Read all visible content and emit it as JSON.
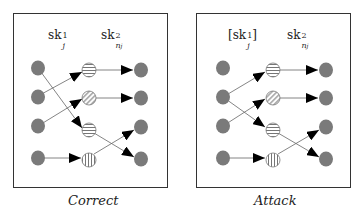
{
  "panels": [
    {
      "id": "correct",
      "caption": "Correct",
      "label_left": "sk",
      "label_left_sup": "1",
      "label_left_sub": "j",
      "label_left_bracketed": false,
      "label_right": "sk",
      "label_right_sup": "2",
      "label_right_sub": "n",
      "label_right_subsub": "j"
    },
    {
      "id": "attack",
      "caption": "Attack",
      "label_left": "sk",
      "label_left_sup": "1",
      "label_left_sub": "j",
      "label_left_bracketed": true,
      "label_right": "sk",
      "label_right_sup": "2",
      "label_right_sub": "n",
      "label_right_subsub": "j"
    }
  ],
  "colors": {
    "node_fill": "#7a7a7a",
    "edge": "#555555",
    "arrow": "#000000",
    "box": "#333333"
  },
  "nodes": {
    "left": [
      "solid",
      "solid",
      "solid",
      "solid"
    ],
    "middle": [
      "horizontal-stripes",
      "diagonal-stripes",
      "horizontal-stripes",
      "vertical-stripes"
    ],
    "right": [
      "solid",
      "solid",
      "solid",
      "solid"
    ]
  },
  "edges": {
    "correct": [
      [
        0,
        2
      ],
      [
        1,
        0
      ],
      [
        2,
        1
      ],
      [
        3,
        3
      ]
    ],
    "attack": [
      [
        1,
        2
      ],
      [
        1,
        0
      ],
      [
        2,
        1
      ],
      [
        3,
        3
      ]
    ],
    "middle_to_right": [
      [
        0,
        0
      ],
      [
        1,
        1
      ],
      [
        2,
        3
      ],
      [
        3,
        2
      ]
    ]
  }
}
